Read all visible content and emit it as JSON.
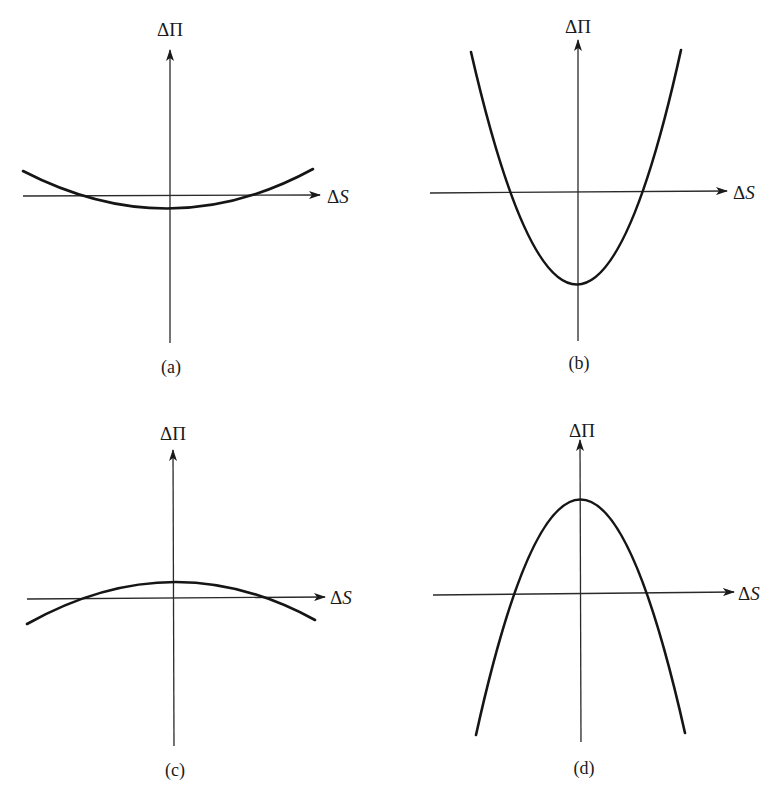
{
  "figure": {
    "panels": [
      {
        "id": "a",
        "caption": "(a)",
        "y_axis_label": "ΔΠ",
        "x_axis_label_delta": "Δ",
        "x_axis_label_var": "S",
        "shape": "shallow upward parabola (minimum slightly below ΔS axis)"
      },
      {
        "id": "b",
        "caption": "(b)",
        "y_axis_label": "ΔΠ",
        "x_axis_label_delta": "Δ",
        "x_axis_label_var": "S",
        "shape": "steep upward parabola (minimum well below ΔS axis)"
      },
      {
        "id": "c",
        "caption": "(c)",
        "y_axis_label": "ΔΠ",
        "x_axis_label_delta": "Δ",
        "x_axis_label_var": "S",
        "shape": "shallow downward parabola (maximum slightly above ΔS axis)"
      },
      {
        "id": "d",
        "caption": "(d)",
        "y_axis_label": "ΔΠ",
        "x_axis_label_delta": "Δ",
        "x_axis_label_var": "S",
        "shape": "steep downward parabola (maximum well above ΔS axis)"
      }
    ]
  },
  "colors": {
    "background": "#ffffff",
    "ink": "#151515"
  }
}
